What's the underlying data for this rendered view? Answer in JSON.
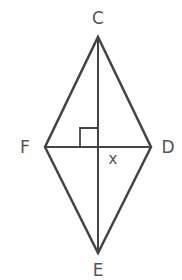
{
  "diagram": {
    "type": "rhombus-with-diagonals",
    "vertices": {
      "C": {
        "label": "C",
        "x": 98,
        "y": 37
      },
      "D": {
        "label": "D",
        "x": 151,
        "y": 147
      },
      "E": {
        "label": "E",
        "x": 98,
        "y": 253
      },
      "F": {
        "label": "F",
        "x": 45,
        "y": 147
      }
    },
    "labels": {
      "C": "C",
      "D": "D",
      "E": "E",
      "F": "F",
      "x": "x"
    },
    "right_angle_marker": true,
    "colors": {
      "line": "#444444",
      "label": "#555555",
      "background": "#ffffff"
    }
  }
}
